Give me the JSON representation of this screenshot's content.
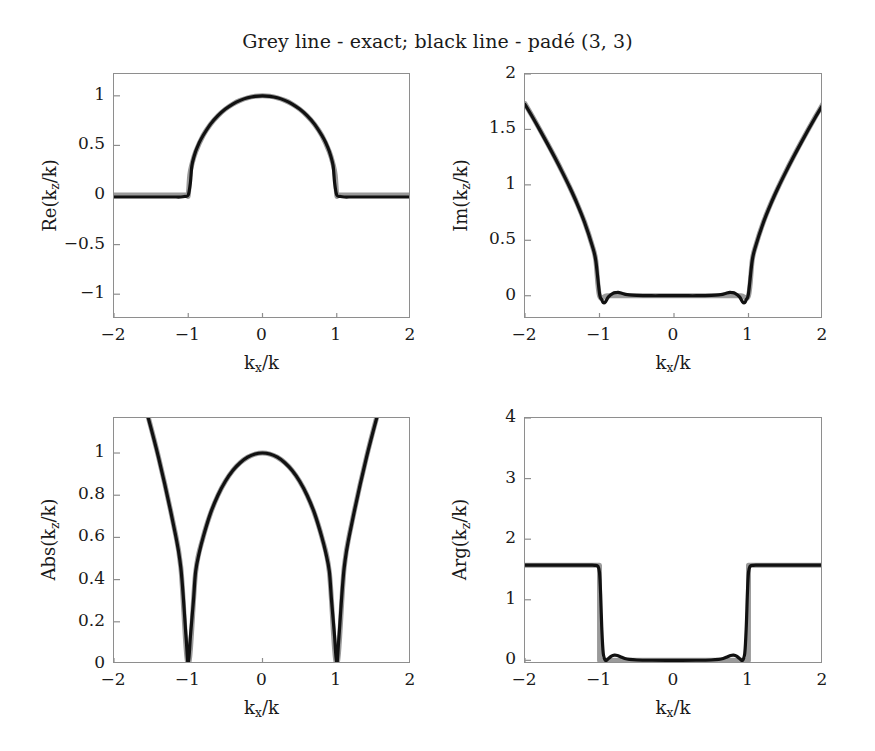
{
  "figure": {
    "title": "Grey line - exact; black line - padé (3, 3)",
    "width": 875,
    "height": 751,
    "background": "#ffffff",
    "exact_color": "#9a9a9a",
    "pade_color": "#111111",
    "axis_color": "#8e8e8e"
  },
  "legend": {
    "exact_label": "Grey line - exact",
    "pade_label": "black line - padé (3, 3)"
  },
  "chart_data": [
    {
      "type": "line",
      "panel": "top-left",
      "title": "",
      "xlabel": "k_x/k",
      "ylabel": "Re(k_z/k)",
      "ylabel_parts": {
        "prefix": "Re(k",
        "sub": "z",
        "suffix": "/k)"
      },
      "xlabel_parts": {
        "prefix": "k",
        "sub": "x",
        "suffix": "/k"
      },
      "xlim": [
        -2,
        2
      ],
      "ylim": [
        -1.25,
        1.22
      ],
      "xticks": [
        -2,
        -1,
        0,
        1,
        2
      ],
      "xticklabels": [
        "−2",
        "−1",
        "0",
        "1",
        "2"
      ],
      "yticks": [
        -1,
        -0.5,
        0,
        0.5,
        1
      ],
      "yticklabels": [
        "−1",
        "−0.5",
        "0",
        "0.5",
        "1"
      ],
      "grid": false,
      "legend_position": "none",
      "series": [
        {
          "name": "exact",
          "color": "#9a9a9a",
          "x": [
            -2.0,
            -1.9,
            -1.8,
            -1.7,
            -1.6,
            -1.5,
            -1.4,
            -1.3,
            -1.2,
            -1.1,
            -1.02,
            -1.0,
            -0.98,
            -0.95,
            -0.9,
            -0.8,
            -0.7,
            -0.6,
            -0.5,
            -0.4,
            -0.3,
            -0.2,
            -0.1,
            0.0,
            0.1,
            0.2,
            0.3,
            0.4,
            0.5,
            0.6,
            0.7,
            0.8,
            0.9,
            0.95,
            0.98,
            1.0,
            1.02,
            1.1,
            1.2,
            1.3,
            1.4,
            1.5,
            1.6,
            1.7,
            1.8,
            1.9,
            2.0
          ],
          "y": [
            0,
            0,
            0,
            0,
            0,
            0,
            0,
            0,
            0,
            0,
            0,
            0,
            0.199,
            0.312,
            0.436,
            0.6,
            0.714,
            0.8,
            0.866,
            0.917,
            0.954,
            0.98,
            0.995,
            1.0,
            0.995,
            0.98,
            0.954,
            0.917,
            0.866,
            0.8,
            0.714,
            0.6,
            0.436,
            0.312,
            0.199,
            0,
            0,
            0,
            0,
            0,
            0,
            0,
            0,
            0,
            0,
            0,
            0
          ]
        },
        {
          "name": "pade (3, 3)",
          "color": "#111111",
          "x": [
            -2.0,
            -1.9,
            -1.8,
            -1.7,
            -1.6,
            -1.5,
            -1.4,
            -1.3,
            -1.2,
            -1.1,
            -1.05,
            -1.0,
            -0.97,
            -0.95,
            -0.9,
            -0.85,
            -0.8,
            -0.7,
            -0.6,
            -0.5,
            -0.4,
            -0.3,
            -0.2,
            -0.1,
            0.0,
            0.1,
            0.2,
            0.3,
            0.4,
            0.5,
            0.6,
            0.7,
            0.8,
            0.85,
            0.9,
            0.95,
            0.97,
            1.0,
            1.05,
            1.1,
            1.2,
            1.3,
            1.4,
            1.5,
            1.6,
            1.7,
            1.8,
            1.9,
            2.0
          ],
          "y": [
            -0.02,
            -0.02,
            -0.02,
            -0.02,
            -0.02,
            -0.02,
            -0.02,
            -0.02,
            -0.02,
            -0.02,
            -0.015,
            0.0,
            0.13,
            0.3,
            0.44,
            0.53,
            0.6,
            0.715,
            0.8,
            0.866,
            0.917,
            0.954,
            0.98,
            0.995,
            1.0,
            0.995,
            0.98,
            0.954,
            0.917,
            0.866,
            0.8,
            0.715,
            0.6,
            0.53,
            0.44,
            0.3,
            0.13,
            0.0,
            -0.015,
            -0.02,
            -0.02,
            -0.02,
            -0.02,
            -0.02,
            -0.02,
            -0.02,
            -0.02,
            -0.02,
            -0.02
          ]
        }
      ]
    },
    {
      "type": "line",
      "panel": "top-right",
      "title": "",
      "xlabel": "k_x/k",
      "ylabel": "Im(k_z/k)",
      "ylabel_parts": {
        "prefix": "Im(k",
        "sub": "z",
        "suffix": "/k)"
      },
      "xlabel_parts": {
        "prefix": "k",
        "sub": "x",
        "suffix": "/k"
      },
      "xlim": [
        -2,
        2
      ],
      "ylim": [
        -0.21,
        2.0
      ],
      "xticks": [
        -2,
        -1,
        0,
        1,
        2
      ],
      "xticklabels": [
        "−2",
        "−1",
        "0",
        "1",
        "2"
      ],
      "yticks": [
        0,
        0.5,
        1,
        1.5,
        2
      ],
      "yticklabels": [
        "0",
        "0.5",
        "1",
        "1.5",
        "2"
      ],
      "grid": false,
      "legend_position": "none",
      "series": [
        {
          "name": "exact",
          "color": "#9a9a9a",
          "x": [
            -2.0,
            -1.9,
            -1.8,
            -1.7,
            -1.6,
            -1.5,
            -1.4,
            -1.3,
            -1.2,
            -1.1,
            -1.05,
            -1.0,
            -0.9,
            -0.7,
            -0.5,
            -0.3,
            0.0,
            0.3,
            0.5,
            0.7,
            0.9,
            1.0,
            1.05,
            1.1,
            1.2,
            1.3,
            1.4,
            1.5,
            1.6,
            1.7,
            1.8,
            1.9,
            2.0
          ],
          "y": [
            1.732,
            1.616,
            1.497,
            1.375,
            1.249,
            1.118,
            0.98,
            0.831,
            0.663,
            0.458,
            0.32,
            0.0,
            0.0,
            0.0,
            0.0,
            0.0,
            0.0,
            0.0,
            0.0,
            0.0,
            0.0,
            0.0,
            0.32,
            0.458,
            0.663,
            0.831,
            0.98,
            1.118,
            1.249,
            1.375,
            1.497,
            1.616,
            1.732
          ]
        },
        {
          "name": "pade (3, 3)",
          "color": "#111111",
          "x": [
            -2.0,
            -1.9,
            -1.8,
            -1.7,
            -1.6,
            -1.5,
            -1.4,
            -1.3,
            -1.2,
            -1.1,
            -1.05,
            -1.0,
            -0.97,
            -0.95,
            -0.92,
            -0.88,
            -0.82,
            -0.78,
            -0.75,
            -0.7,
            -0.65,
            -0.6,
            -0.5,
            -0.4,
            -0.3,
            -0.2,
            -0.1,
            0.0,
            0.1,
            0.2,
            0.3,
            0.4,
            0.5,
            0.6,
            0.65,
            0.7,
            0.75,
            0.78,
            0.82,
            0.88,
            0.92,
            0.95,
            0.97,
            1.0,
            1.05,
            1.1,
            1.2,
            1.3,
            1.4,
            1.5,
            1.6,
            1.7,
            1.8,
            1.9,
            2.0
          ],
          "y": [
            1.725,
            1.612,
            1.494,
            1.372,
            1.246,
            1.115,
            0.978,
            0.829,
            0.661,
            0.456,
            0.318,
            0.02,
            -0.035,
            -0.062,
            -0.055,
            -0.01,
            0.022,
            0.028,
            0.03,
            0.022,
            0.012,
            0.007,
            0.003,
            0.001,
            0.0,
            0.0,
            0.0,
            0.0,
            0.0,
            0.0,
            0.0,
            0.001,
            0.003,
            0.007,
            0.012,
            0.022,
            0.03,
            0.028,
            0.022,
            -0.01,
            -0.055,
            -0.062,
            -0.035,
            0.02,
            0.318,
            0.456,
            0.661,
            0.829,
            0.978,
            1.115,
            1.246,
            1.372,
            1.494,
            1.612,
            1.725
          ]
        }
      ]
    },
    {
      "type": "line",
      "panel": "bottom-left",
      "title": "",
      "xlabel": "k_x/k",
      "ylabel": "Abs(k_z/k)",
      "ylabel_parts": {
        "prefix": "Abs(k",
        "sub": "z",
        "suffix": "/k)"
      },
      "xlabel_parts": {
        "prefix": "k",
        "sub": "x",
        "suffix": "/k"
      },
      "xlim": [
        -2,
        2
      ],
      "ylim": [
        0,
        1.166
      ],
      "xticks": [
        -2,
        -1,
        0,
        1,
        2
      ],
      "xticklabels": [
        "−2",
        "−1",
        "0",
        "1",
        "2"
      ],
      "yticks": [
        0,
        0.2,
        0.4,
        0.6,
        0.8,
        1
      ],
      "yticklabels": [
        "0",
        "0.2",
        "0.4",
        "0.6",
        "0.8",
        "1"
      ],
      "grid": false,
      "legend_position": "none",
      "series": [
        {
          "name": "exact",
          "color": "#9a9a9a",
          "x": [
            -2.0,
            -1.8,
            -1.6,
            -1.4,
            -1.2,
            -1.1,
            -1.0,
            -0.9,
            -0.8,
            -0.7,
            -0.6,
            -0.5,
            -0.4,
            -0.3,
            -0.2,
            -0.1,
            0.0,
            0.1,
            0.2,
            0.3,
            0.4,
            0.5,
            0.6,
            0.7,
            0.8,
            0.9,
            1.0,
            1.1,
            1.2,
            1.4,
            1.6,
            1.8,
            2.0
          ],
          "y": [
            1.732,
            1.497,
            1.249,
            0.98,
            0.663,
            0.458,
            0.0,
            0.436,
            0.6,
            0.714,
            0.8,
            0.866,
            0.917,
            0.954,
            0.98,
            0.995,
            1.0,
            0.995,
            0.98,
            0.954,
            0.917,
            0.866,
            0.8,
            0.714,
            0.6,
            0.436,
            0.0,
            0.458,
            0.663,
            0.98,
            1.249,
            1.497,
            1.732
          ]
        },
        {
          "name": "pade (3, 3)",
          "color": "#111111",
          "x": [
            -2.0,
            -1.8,
            -1.6,
            -1.4,
            -1.2,
            -1.1,
            -1.03,
            -1.0,
            -0.97,
            -0.93,
            -0.9,
            -0.85,
            -0.8,
            -0.7,
            -0.6,
            -0.5,
            -0.4,
            -0.3,
            -0.2,
            -0.1,
            0.0,
            0.1,
            0.2,
            0.3,
            0.4,
            0.5,
            0.6,
            0.7,
            0.8,
            0.85,
            0.9,
            0.93,
            0.97,
            1.0,
            1.03,
            1.1,
            1.2,
            1.4,
            1.6,
            1.8,
            2.0
          ],
          "y": [
            1.725,
            1.494,
            1.246,
            0.978,
            0.661,
            0.456,
            0.13,
            0.0,
            0.135,
            0.3,
            0.44,
            0.53,
            0.6,
            0.715,
            0.8,
            0.866,
            0.917,
            0.954,
            0.98,
            0.995,
            1.0,
            0.995,
            0.98,
            0.954,
            0.917,
            0.866,
            0.8,
            0.715,
            0.6,
            0.53,
            0.44,
            0.3,
            0.135,
            0.0,
            0.13,
            0.456,
            0.661,
            0.978,
            1.246,
            1.494,
            1.725
          ]
        }
      ]
    },
    {
      "type": "line",
      "panel": "bottom-right",
      "title": "",
      "xlabel": "k_x/k",
      "ylabel": "Arg(k_z/k)",
      "ylabel_parts": {
        "prefix": "Arg(k",
        "sub": "z",
        "suffix": "/k)"
      },
      "xlabel_parts": {
        "prefix": "k",
        "sub": "x",
        "suffix": "/k"
      },
      "xlim": [
        -2,
        2
      ],
      "ylim": [
        -0.06,
        4.0
      ],
      "xticks": [
        -2,
        -1,
        0,
        1,
        2
      ],
      "xticklabels": [
        "−2",
        "−1",
        "0",
        "1",
        "2"
      ],
      "yticks": [
        0,
        1,
        2,
        3,
        4
      ],
      "yticklabels": [
        "0",
        "1",
        "2",
        "3",
        "4"
      ],
      "grid": false,
      "legend_position": "none",
      "plateau_value": 1.5708,
      "series": [
        {
          "name": "exact",
          "color": "#9a9a9a",
          "x": [
            -2.0,
            -1.5,
            -1.2,
            -1.05,
            -1.0,
            -0.999,
            -0.9,
            -0.5,
            0.0,
            0.5,
            0.9,
            0.999,
            1.0,
            1.05,
            1.2,
            1.5,
            2.0
          ],
          "y": [
            1.5708,
            1.5708,
            1.5708,
            1.5708,
            1.5708,
            0.0,
            0.0,
            0.0,
            0.0,
            0.0,
            0.0,
            0.0,
            1.5708,
            1.5708,
            1.5708,
            1.5708,
            1.5708
          ]
        },
        {
          "name": "pade (3, 3)",
          "color": "#111111",
          "x": [
            -2.0,
            -1.6,
            -1.3,
            -1.15,
            -1.06,
            -1.02,
            -1.0,
            -0.985,
            -0.97,
            -0.95,
            -0.92,
            -0.88,
            -0.84,
            -0.8,
            -0.76,
            -0.72,
            -0.66,
            -0.6,
            -0.5,
            -0.3,
            0.0,
            0.3,
            0.5,
            0.6,
            0.66,
            0.72,
            0.76,
            0.8,
            0.84,
            0.88,
            0.92,
            0.95,
            0.97,
            0.985,
            1.0,
            1.02,
            1.06,
            1.15,
            1.3,
            1.6,
            2.0
          ],
          "y": [
            1.5708,
            1.5708,
            1.5708,
            1.5705,
            1.569,
            1.55,
            1.45,
            1.1,
            0.55,
            0.12,
            0.0,
            0.03,
            0.07,
            0.085,
            0.08,
            0.06,
            0.03,
            0.015,
            0.006,
            0.002,
            0.0,
            0.002,
            0.006,
            0.015,
            0.03,
            0.06,
            0.08,
            0.085,
            0.07,
            0.03,
            0.0,
            0.12,
            0.55,
            1.1,
            1.45,
            1.55,
            1.569,
            1.5705,
            1.5708,
            1.5708,
            1.5708
          ]
        }
      ]
    }
  ],
  "panels": [
    {
      "name": "re-panel",
      "box": {
        "left": 113,
        "top": 73,
        "width": 297,
        "height": 245
      }
    },
    {
      "name": "im-panel",
      "box": {
        "left": 524,
        "top": 73,
        "width": 298,
        "height": 245
      }
    },
    {
      "name": "abs-panel",
      "box": {
        "left": 113,
        "top": 417,
        "width": 297,
        "height": 246
      }
    },
    {
      "name": "arg-panel",
      "box": {
        "left": 524,
        "top": 417,
        "width": 298,
        "height": 246
      }
    }
  ]
}
